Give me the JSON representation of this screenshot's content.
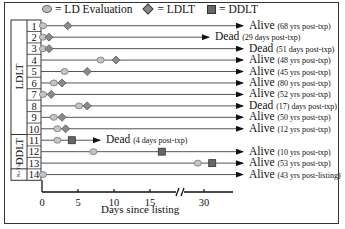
{
  "chart_data": {
    "type": "swimmer",
    "title": "",
    "xlabel": "Days since listing",
    "ylabel": "",
    "x_ticks": [
      "0",
      "5",
      "10",
      "15",
      "30"
    ],
    "axis_break_between": [
      15,
      30
    ],
    "legend": [
      {
        "symbol": "circle",
        "label": "= LD Evaluation"
      },
      {
        "symbol": "diamond",
        "label": "= LDLT"
      },
      {
        "symbol": "square",
        "label": "= DDLT"
      }
    ],
    "groups": [
      {
        "name": "LDLT",
        "rows": [
          1,
          2,
          3,
          4,
          5,
          6,
          7,
          8,
          9,
          10
        ]
      },
      {
        "name": "DDLT",
        "rows": [
          11,
          12,
          13
        ]
      },
      {
        "name": "No Txp",
        "rows": [
          14
        ]
      }
    ],
    "patients": [
      {
        "id": "1",
        "ld_eval": 0,
        "ldlt": 3.3,
        "ddlt": null,
        "line_end": "full",
        "outcome": "Alive",
        "detail": "(68 yrs post-txp)"
      },
      {
        "id": "2",
        "ld_eval": 0,
        "ldlt": 0.7,
        "ddlt": null,
        "line_end": 23,
        "outcome": "Dead",
        "detail": "(29 days post-txp)"
      },
      {
        "id": "3",
        "ld_eval": 0,
        "ldlt": 0.7,
        "ddlt": null,
        "line_end": "full",
        "outcome": "Dead",
        "detail": "(51 days post-txp)"
      },
      {
        "id": "4",
        "ld_eval": 8,
        "ldlt": 10,
        "ddlt": null,
        "line_end": "full",
        "outcome": "Alive",
        "detail": "(48 yrs post-txp)"
      },
      {
        "id": "5",
        "ld_eval": 3,
        "ldlt": 6,
        "ddlt": null,
        "line_end": "full",
        "outcome": "Alive",
        "detail": "(45 yrs post-txp)"
      },
      {
        "id": "6",
        "ld_eval": 1.5,
        "ldlt": 2.5,
        "ddlt": null,
        "line_end": "full",
        "outcome": "Alive",
        "detail": "(80 yrs post-txp)"
      },
      {
        "id": "7",
        "ld_eval": 0,
        "ldlt": 1,
        "ddlt": null,
        "line_end": "full",
        "outcome": "Alive",
        "detail": "(52 yrs post-txp)"
      },
      {
        "id": "8",
        "ld_eval": 5,
        "ldlt": 6,
        "ddlt": null,
        "line_end": "full",
        "outcome": "Dead",
        "detail": "(17) days post-txp)"
      },
      {
        "id": "9",
        "ld_eval": 1.5,
        "ldlt": 2.5,
        "ddlt": null,
        "line_end": "full",
        "outcome": "Alive",
        "detail": "(50 yrs post-txp)"
      },
      {
        "id": "10",
        "ld_eval": 2,
        "ldlt": 3,
        "ddlt": null,
        "line_end": "full",
        "outcome": "Alive",
        "detail": "(12 yrs post-txp)"
      },
      {
        "id": "11",
        "ld_eval": 2,
        "ldlt": null,
        "ddlt": 4,
        "line_end": 8,
        "outcome": "Dead",
        "detail": "(4 days post-txp)"
      },
      {
        "id": "12",
        "ld_eval": 7,
        "ldlt": null,
        "ddlt": 16.5,
        "line_end": "full",
        "outcome": "Alive",
        "detail": "(10 yrs post-txp)"
      },
      {
        "id": "13",
        "ld_eval": 29,
        "ldlt": null,
        "ddlt": 31,
        "line_end": "full",
        "outcome": "Alive",
        "detail": "(53 yrs post-txp)"
      },
      {
        "id": "14",
        "ld_eval": 0,
        "ldlt": null,
        "ddlt": null,
        "line_end": "full",
        "outcome": "Alive",
        "detail": "(43 yrs post-listing)"
      }
    ]
  },
  "legend": {
    "ld_eval": "= LD Evaluation",
    "ldlt": "= LDLT",
    "ddlt": "= DDLT"
  },
  "groups": {
    "ldlt": "LDLT",
    "ddlt": "DDLT",
    "notxp": "No Txp"
  },
  "axis": {
    "xlabel": "Days since listing",
    "ticks": [
      "0",
      "5",
      "10",
      "15",
      "30"
    ]
  },
  "rows": [
    {
      "id": "1",
      "outcome": "Alive",
      "detail": "(68 yrs post-txp)"
    },
    {
      "id": "2",
      "outcome": "Dead",
      "detail": "(29 days post-txp)"
    },
    {
      "id": "3",
      "outcome": "Dead",
      "detail": "(51 days post-txp)"
    },
    {
      "id": "4",
      "outcome": "Alive",
      "detail": "(48 yrs post-txp)"
    },
    {
      "id": "5",
      "outcome": "Alive",
      "detail": "(45 yrs post-txp)"
    },
    {
      "id": "6",
      "outcome": "Alive",
      "detail": "(80 yrs post-txp)"
    },
    {
      "id": "7",
      "outcome": "Alive",
      "detail": "(52 yrs post-txp)"
    },
    {
      "id": "8",
      "outcome": "Dead",
      "detail": "(17) days post-txp)"
    },
    {
      "id": "9",
      "outcome": "Alive",
      "detail": "(50 yrs post-txp)"
    },
    {
      "id": "10",
      "outcome": "Alive",
      "detail": "(12 yrs post-txp)"
    },
    {
      "id": "11",
      "outcome": "Dead",
      "detail": "(4 days post-txp)"
    },
    {
      "id": "12",
      "outcome": "Alive",
      "detail": "(10 yrs post-txp)"
    },
    {
      "id": "13",
      "outcome": "Alive",
      "detail": "(53 yrs post-txp)"
    },
    {
      "id": "14",
      "outcome": "Alive",
      "detail": "(43 yrs post-listing)"
    }
  ]
}
